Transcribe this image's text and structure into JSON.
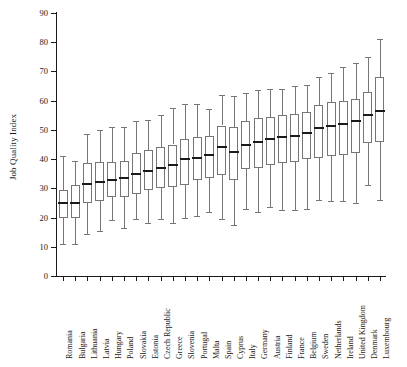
{
  "chart_data": {
    "type": "box",
    "title": "",
    "xlabel": "",
    "ylabel": "Job Quality Index",
    "ylim": [
      0,
      90
    ],
    "yticks": [
      0,
      10,
      20,
      30,
      40,
      50,
      60,
      70,
      80,
      90
    ],
    "grid": false,
    "legend": null,
    "categories": [
      "Romania",
      "Bulgaria",
      "Lithuania",
      "Latvia",
      "Hungary",
      "Poland",
      "Slovakia",
      "Estonia",
      "Czech Republic",
      "Greece",
      "Slovenia",
      "Portugal",
      "Malta",
      "Spain",
      "Cyprus",
      "Italy",
      "Germany",
      "Austria",
      "Finland",
      "France",
      "Belgium",
      "Sweden",
      "Netherlands",
      "Ireland",
      "United Kingdom",
      "Denmark",
      "Luxembourg"
    ],
    "box_stats": [
      {
        "category": "Romania",
        "whisker_low": 11,
        "q1": 20,
        "median": 25,
        "q3": 29.5,
        "whisker_high": 41
      },
      {
        "category": "Bulgaria",
        "whisker_low": 11,
        "q1": 20,
        "median": 25,
        "q3": 31,
        "whisker_high": 39.5
      },
      {
        "category": "Lithuania",
        "whisker_low": 14.5,
        "q1": 25,
        "median": 31.5,
        "q3": 38.5,
        "whisker_high": 48.5
      },
      {
        "category": "Latvia",
        "whisker_low": 15.5,
        "q1": 25.5,
        "median": 32,
        "q3": 39,
        "whisker_high": 50
      },
      {
        "category": "Hungary",
        "whisker_low": 19,
        "q1": 27,
        "median": 33,
        "q3": 39,
        "whisker_high": 51
      },
      {
        "category": "Poland",
        "whisker_low": 16.5,
        "q1": 27,
        "median": 33.5,
        "q3": 39.5,
        "whisker_high": 51
      },
      {
        "category": "Slovakia",
        "whisker_low": 19.5,
        "q1": 28,
        "median": 35,
        "q3": 42,
        "whisker_high": 53
      },
      {
        "category": "Estonia",
        "whisker_low": 18,
        "q1": 29.5,
        "median": 36,
        "q3": 43,
        "whisker_high": 53.5
      },
      {
        "category": "Czech Republic",
        "whisker_low": 19.5,
        "q1": 30,
        "median": 37,
        "q3": 44,
        "whisker_high": 55
      },
      {
        "category": "Greece",
        "whisker_low": 18,
        "q1": 30.5,
        "median": 38,
        "q3": 45,
        "whisker_high": 57.5
      },
      {
        "category": "Slovenia",
        "whisker_low": 20,
        "q1": 31,
        "median": 40,
        "q3": 47,
        "whisker_high": 59
      },
      {
        "category": "Portugal",
        "whisker_low": 20.5,
        "q1": 33,
        "median": 40.5,
        "q3": 47.5,
        "whisker_high": 59
      },
      {
        "category": "Malta",
        "whisker_low": 22,
        "q1": 33.5,
        "median": 41.5,
        "q3": 48,
        "whisker_high": 57
      },
      {
        "category": "Spain",
        "whisker_low": 19.5,
        "q1": 34.5,
        "median": 44,
        "q3": 51.5,
        "whisker_high": 62
      },
      {
        "category": "Cyprus",
        "whisker_low": 17.5,
        "q1": 33,
        "median": 42.5,
        "q3": 51,
        "whisker_high": 61.5
      },
      {
        "category": "Italy",
        "whisker_low": 23,
        "q1": 36.5,
        "median": 45,
        "q3": 53,
        "whisker_high": 62.5
      },
      {
        "category": "Germany",
        "whisker_low": 22,
        "q1": 37,
        "median": 46,
        "q3": 54,
        "whisker_high": 63.5
      },
      {
        "category": "Austria",
        "whisker_low": 23.5,
        "q1": 38,
        "median": 47,
        "q3": 54.5,
        "whisker_high": 64
      },
      {
        "category": "Finland",
        "whisker_low": 22.5,
        "q1": 38.5,
        "median": 47.5,
        "q3": 55,
        "whisker_high": 64
      },
      {
        "category": "France",
        "whisker_low": 22.5,
        "q1": 39,
        "median": 48,
        "q3": 55.5,
        "whisker_high": 65
      },
      {
        "category": "Belgium",
        "whisker_low": 23,
        "q1": 40,
        "median": 49,
        "q3": 56,
        "whisker_high": 65.5
      },
      {
        "category": "Sweden",
        "whisker_low": 26,
        "q1": 40.5,
        "median": 50.5,
        "q3": 58.5,
        "whisker_high": 68
      },
      {
        "category": "Netherlands",
        "whisker_low": 25.5,
        "q1": 41,
        "median": 51.5,
        "q3": 59.5,
        "whisker_high": 69.5
      },
      {
        "category": "Ireland",
        "whisker_low": 25.5,
        "q1": 41.5,
        "median": 52,
        "q3": 60,
        "whisker_high": 71.5
      },
      {
        "category": "United Kingdom",
        "whisker_low": 25,
        "q1": 42,
        "median": 53,
        "q3": 60.5,
        "whisker_high": 73
      },
      {
        "category": "Denmark",
        "whisker_low": 31,
        "q1": 45.5,
        "median": 55,
        "q3": 63,
        "whisker_high": 75
      },
      {
        "category": "Luxembourg",
        "whisker_low": 26,
        "q1": 46,
        "median": 56.5,
        "q3": 68,
        "whisker_high": 81
      }
    ],
    "colors": {
      "box_stroke": "#767676",
      "median": "#1a1a1a",
      "whisker": "#767676",
      "axis": "#1a1a1a",
      "background": "#ffffff"
    }
  }
}
